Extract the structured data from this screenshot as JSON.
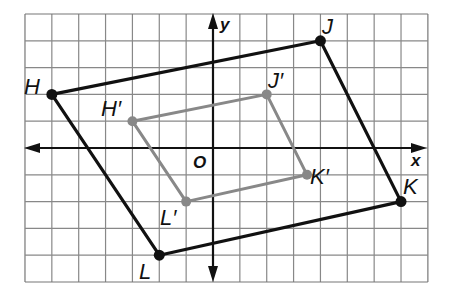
{
  "diagram": {
    "grid": {
      "x_min": -7,
      "x_max": 8,
      "y_min": -5,
      "y_max": 5,
      "origin_px": [
        213,
        148
      ],
      "unit_px_x": 26.86,
      "unit_px_y": 26.8,
      "line_color": "#888888",
      "border_color": "#777777"
    },
    "axes": {
      "x_label": "x",
      "y_label": "y",
      "origin_label": "O",
      "color": "#111111"
    },
    "preimage": {
      "name": "HJKL",
      "color": "#111111",
      "vertices": [
        {
          "label": "H",
          "x": -6,
          "y": 2
        },
        {
          "label": "J",
          "x": 4,
          "y": 4
        },
        {
          "label": "K",
          "x": 7,
          "y": -2
        },
        {
          "label": "L",
          "x": -2,
          "y": -4
        }
      ]
    },
    "image": {
      "name": "H'J'K'L'",
      "color": "#888888",
      "vertices": [
        {
          "label": "H′",
          "x": -3,
          "y": 1
        },
        {
          "label": "J′",
          "x": 2,
          "y": 2
        },
        {
          "label": "K′",
          "x": 3.5,
          "y": -1
        },
        {
          "label": "L′",
          "x": -1,
          "y": -2
        }
      ]
    },
    "labels": {
      "H": "H",
      "J": "J",
      "K": "K",
      "L": "L",
      "H_prime": "H′",
      "J_prime": "J′",
      "K_prime": "K′",
      "L_prime": "L′"
    }
  }
}
